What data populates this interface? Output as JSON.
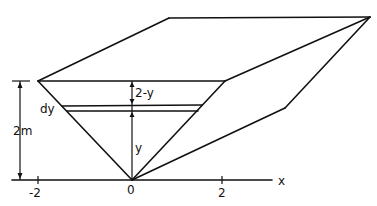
{
  "diagram": {
    "labels": {
      "height_dim": "2m",
      "strip": "dy",
      "depth_above": "2-y",
      "depth_below": "y",
      "x_axis": "x",
      "tick_neg": "-2",
      "tick_zero": "0",
      "tick_pos": "2"
    },
    "colors": {
      "stroke": "#111111",
      "background": "#ffffff"
    }
  }
}
